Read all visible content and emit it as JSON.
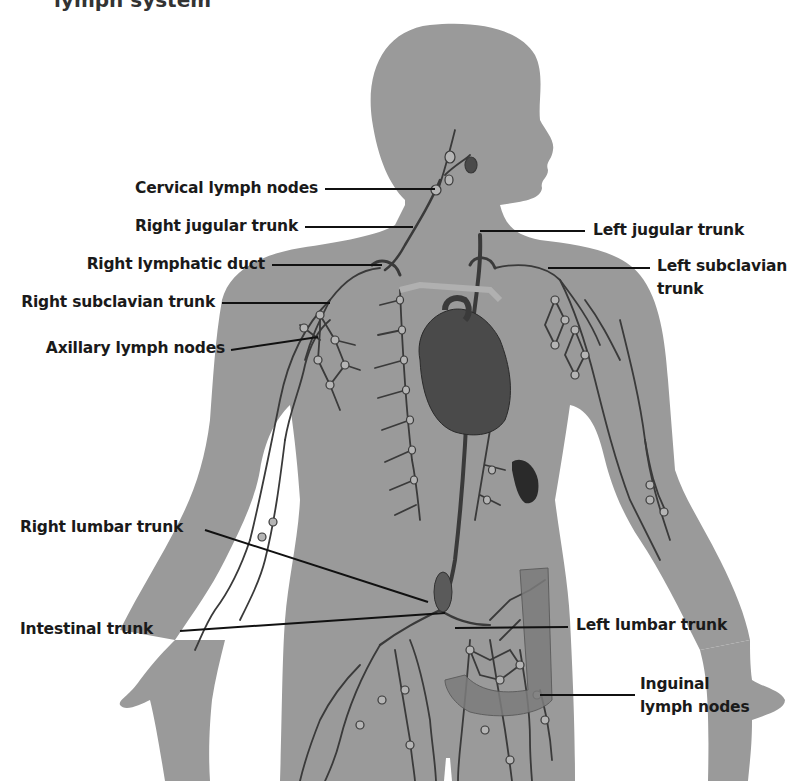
{
  "title": "lymph system",
  "colors": {
    "body": "#9a9a9a",
    "vessel": "#3a3a3a",
    "node_fill": "#b5b5b5",
    "heart": "#4a4a4a",
    "spleen": "#2a2a2a",
    "colon": "#7c7c7c",
    "leader": "#111111",
    "text": "#1a1a1a"
  },
  "labels": {
    "cervical_lymph_nodes": "Cervical lymph nodes",
    "right_jugular_trunk": "Right jugular trunk",
    "right_lymphatic_duct": "Right lymphatic duct",
    "right_subclavian_trunk": "Right subclavian trunk",
    "axillary_lymph_nodes": "Axillary lymph nodes",
    "right_lumbar_trunk": "Right lumbar trunk",
    "intestinal_trunk": "Intestinal trunk",
    "left_jugular_trunk": "Left jugular trunk",
    "left_subclavian_trunk_line1": "Left subclavian",
    "left_subclavian_trunk_line2": "trunk",
    "left_lumbar_trunk": "Left lumbar trunk",
    "inguinal_lymph_nodes_line1": "Inguinal",
    "inguinal_lymph_nodes_line2": "lymph nodes"
  }
}
